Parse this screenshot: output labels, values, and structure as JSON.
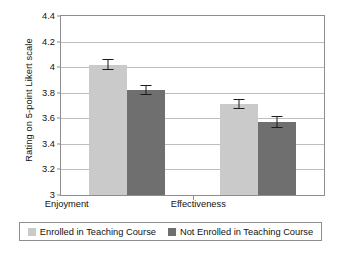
{
  "chart_data": {
    "type": "bar",
    "title": "",
    "xlabel": "",
    "ylabel": "Rating on 5-point Likert scale",
    "categories": [
      "Enjoyment",
      "Effectiveness"
    ],
    "ylim": [
      3,
      4.4
    ],
    "yticks": [
      "3",
      "3.2",
      "3.4",
      "3.6",
      "3.8",
      "4",
      "4.2",
      "4.4"
    ],
    "ytick_values": [
      3,
      3.2,
      3.4,
      3.6,
      3.8,
      4,
      4.2,
      4.4
    ],
    "grid": "horizontal",
    "legend_position": "bottom",
    "series": [
      {
        "name": "Enrolled in Teaching Course",
        "color": "#cacaca",
        "values": [
          4.02,
          3.71
        ],
        "errors": [
          0.045,
          0.04
        ]
      },
      {
        "name": "Not Enrolled in Teaching Course",
        "color": "#6f6f6f",
        "values": [
          3.82,
          3.57
        ],
        "errors": [
          0.04,
          0.045
        ]
      }
    ]
  },
  "legend": {
    "entries": [
      {
        "label": "Enrolled in Teaching Course"
      },
      {
        "label": "Not Enrolled in Teaching Course"
      }
    ]
  },
  "colors": {
    "series_light": "#cacaca",
    "series_dark": "#6f6f6f",
    "gridline": "#bdbdbd",
    "frame": "#8d8d8d",
    "text": "#111111"
  }
}
